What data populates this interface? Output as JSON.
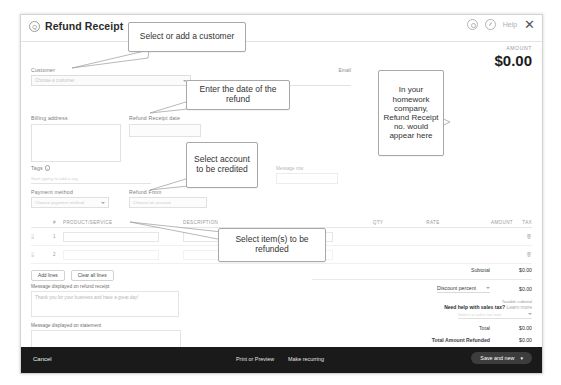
{
  "window": {
    "title": "Refund Receipt",
    "subtitle": "",
    "icons": {
      "qb_logo": "quickbooks-logo-icon",
      "settings": "gear-icon",
      "help": "help-circle-icon",
      "help_label": "Help",
      "close": "close-icon"
    }
  },
  "amount": {
    "label": "AMOUNT",
    "value": "$0.00"
  },
  "form": {
    "customer_label": "Customer",
    "customer_placeholder": "Choose a customer",
    "email_label": "Email",
    "email_placeholder": "Separate emails with a comma",
    "cc_line": "Cc/Bcc",
    "billing_label": "Billing address",
    "refund_date_label": "Refund Receipt date",
    "refund_date_value": "",
    "tags_label": "Tags",
    "tags_placeholder": "Start typing to add a tag",
    "payment_method_label": "Payment method",
    "payment_method_placeholder": "Choose payment method",
    "refund_from_label": "Refund From",
    "refund_from_placeholder": "Choose an account",
    "message_row_label": "Message row",
    "info_icon": "info-icon"
  },
  "table": {
    "headers": {
      "num": "#",
      "product": "PRODUCT/SERVICE",
      "description": "DESCRIPTION",
      "qty": "QTY",
      "rate": "RATE",
      "amount": "AMOUNT",
      "tax": "TAX"
    },
    "rows": [
      {
        "num": "1",
        "product": "",
        "description": "",
        "qty": "",
        "rate": "",
        "amount": "",
        "tax": ""
      },
      {
        "num": "2",
        "product": "",
        "description": "",
        "qty": "",
        "rate": "",
        "amount": "",
        "tax": ""
      }
    ],
    "add_lines": "Add lines",
    "clear_all_lines": "Clear all lines"
  },
  "messages": {
    "refund_label": "Message displayed on refund receipt",
    "refund_value": "Thank you for your business and have a great day!",
    "statement_label": "Message displayed on statement",
    "statement_value": ""
  },
  "totals": {
    "subtotal_label": "Subtotal",
    "subtotal_value": "$0.00",
    "discount_label": "Discount percent",
    "discount_value": "$0.00",
    "taxable_subtotal_label": "Taxable subtotal",
    "taxable_subtotal_value": "$0.00",
    "sales_tax_help": "Need help with sales tax?",
    "sales_tax_link": "Learn more",
    "tax_select_placeholder": "Select a sales tax rate",
    "total_label": "Total",
    "total_value": "$0.00",
    "refunded_label": "Total Amount Refunded",
    "refunded_value": "$0.00"
  },
  "footer": {
    "cancel": "Cancel",
    "print_preview": "Print or Preview",
    "make_recurring": "Make recurring",
    "save_and_new": "Save and new",
    "save_dropdown": "▾"
  },
  "callouts": [
    {
      "id": "customer",
      "text": "Select or add a customer"
    },
    {
      "id": "date",
      "text": "Enter the date of the refund"
    },
    {
      "id": "account",
      "text": "Select account to be credited"
    },
    {
      "id": "receipt_no",
      "text": "In your homework company, Refund Receipt no. would appear here"
    },
    {
      "id": "items",
      "text": "Select item(s) to be refunded"
    }
  ]
}
